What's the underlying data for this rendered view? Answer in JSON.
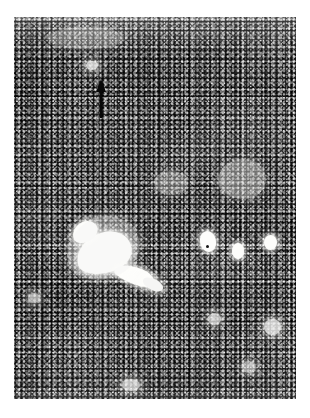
{
  "figure": {
    "domain": "Natural-Image",
    "kind": "histological-micrograph",
    "caption": "",
    "label": "",
    "scale_bar": "",
    "background_color": "#ffffff",
    "plate_tone_color": "#8e8e8e",
    "ink_color": "#101010",
    "highlight_color": "#f4f4f2"
  },
  "plate": {
    "left": 14,
    "top": 17,
    "width": 282,
    "height": 382
  },
  "annotations": [
    {
      "name": "arrow-marker",
      "type": "arrow",
      "direction": "up",
      "color": "#080808",
      "tip_x": 101,
      "tip_y": 79,
      "tail_y": 118,
      "label": ""
    }
  ],
  "features": [
    {
      "name": "large-vascular-space",
      "shape": "irregular",
      "x": 78,
      "y": 248,
      "w": 58,
      "h": 44,
      "tone": "bright"
    },
    {
      "name": "vascular-space-branch",
      "shape": "elongate",
      "x": 118,
      "y": 284,
      "w": 36,
      "h": 16,
      "tone": "bright"
    },
    {
      "name": "vascular-space-upper-lobe",
      "shape": "oval",
      "x": 74,
      "y": 232,
      "w": 26,
      "h": 18,
      "tone": "bright"
    },
    {
      "name": "round-vessel-right-upper",
      "shape": "oval",
      "x": 208,
      "y": 240,
      "w": 17,
      "h": 22,
      "tone": "bright"
    },
    {
      "name": "round-vessel-right-middle",
      "shape": "oval",
      "x": 238,
      "y": 251,
      "w": 13,
      "h": 17,
      "tone": "bright"
    },
    {
      "name": "round-vessel-right-edge",
      "shape": "oval",
      "x": 268,
      "y": 243,
      "w": 14,
      "h": 16,
      "tone": "bright"
    },
    {
      "name": "small-vessel-lower-right",
      "shape": "round",
      "x": 272,
      "y": 330,
      "w": 17,
      "h": 17,
      "tone": "soft"
    },
    {
      "name": "small-vessel-lower-mid",
      "shape": "round",
      "x": 214,
      "y": 322,
      "w": 14,
      "h": 13,
      "tone": "soft"
    },
    {
      "name": "pale-zone-upper-right",
      "shape": "diffuse",
      "x": 228,
      "y": 168,
      "w": 48,
      "h": 40,
      "tone": "dim"
    },
    {
      "name": "pale-zone-center",
      "shape": "diffuse",
      "x": 160,
      "y": 178,
      "w": 34,
      "h": 26,
      "tone": "dim"
    },
    {
      "name": "pale-spot-above-arrow",
      "shape": "round",
      "x": 89,
      "y": 66,
      "w": 11,
      "h": 9,
      "tone": "soft"
    },
    {
      "name": "pale-band-upper-left",
      "shape": "diffuse",
      "x": 52,
      "y": 30,
      "w": 70,
      "h": 22,
      "tone": "dim"
    },
    {
      "name": "pale-spot-bottom-center",
      "shape": "round",
      "x": 128,
      "y": 386,
      "w": 18,
      "h": 12,
      "tone": "soft"
    },
    {
      "name": "pale-spot-left-lower",
      "shape": "round",
      "x": 30,
      "y": 300,
      "w": 12,
      "h": 10,
      "tone": "soft"
    },
    {
      "name": "pale-spot-right-lower",
      "shape": "round",
      "x": 248,
      "y": 368,
      "w": 14,
      "h": 12,
      "tone": "soft"
    }
  ]
}
